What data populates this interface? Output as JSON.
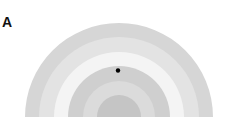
{
  "panel": {
    "label": "A"
  },
  "diagram": {
    "type": "concentric-semicircles",
    "center": {
      "x": 119,
      "y": 117
    },
    "bands": [
      {
        "radius": 94,
        "color": "#d6d6d6"
      },
      {
        "radius": 80,
        "color": "#e3e3e3"
      },
      {
        "radius": 65,
        "color": "#f4f4f4"
      },
      {
        "radius": 51,
        "color": "#cfcfcf"
      },
      {
        "radius": 36,
        "color": "#dbdbdb"
      },
      {
        "radius": 22,
        "color": "#c5c5c5"
      }
    ],
    "marker": {
      "x": 118,
      "y": 70.5,
      "radius": 2.2,
      "color": "#000000"
    }
  }
}
